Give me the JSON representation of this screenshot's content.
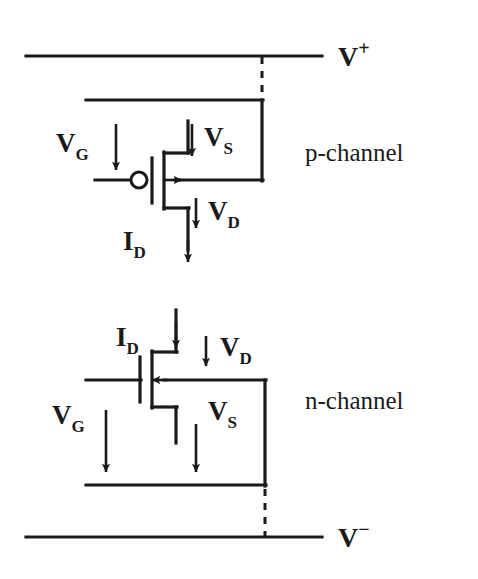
{
  "figure": {
    "background_color": "#ffffff",
    "ink_color": "#1a1a1a"
  },
  "rails": {
    "positive": {
      "label_base": "V",
      "label_sign": "+",
      "full_label": "V+",
      "name": "positive-supply-rail"
    },
    "negative": {
      "label_base": "V",
      "label_sign": "−",
      "full_label": "V−",
      "name": "negative-supply-rail"
    }
  },
  "sections": [
    {
      "id": "p-channel",
      "caption": "p-channel",
      "device": "p-channel MOSFET",
      "gate_bubble": true,
      "channel_arrow_direction": "right",
      "labels": [
        {
          "base": "V",
          "sub": "G",
          "full": "VG",
          "name": "gate-voltage-label",
          "arrow": "down",
          "arrow_side": "right"
        },
        {
          "base": "V",
          "sub": "S",
          "full": "VS",
          "name": "source-voltage-label",
          "arrow": "down",
          "arrow_side": "left"
        },
        {
          "base": "V",
          "sub": "D",
          "full": "VD",
          "name": "drain-voltage-label",
          "arrow": "down",
          "arrow_side": "left"
        },
        {
          "base": "I",
          "sub": "D",
          "full": "ID",
          "name": "drain-current-label",
          "arrow": "down",
          "arrow_side": "right"
        }
      ]
    },
    {
      "id": "n-channel",
      "caption": "n-channel",
      "device": "n-channel MOSFET",
      "gate_bubble": false,
      "channel_arrow_direction": "left",
      "labels": [
        {
          "base": "I",
          "sub": "D",
          "full": "ID",
          "name": "drain-current-label",
          "arrow": "down",
          "arrow_side": "right"
        },
        {
          "base": "V",
          "sub": "D",
          "full": "VD",
          "name": "drain-voltage-label",
          "arrow": "down",
          "arrow_side": "left"
        },
        {
          "base": "V",
          "sub": "G",
          "full": "VG",
          "name": "gate-voltage-label",
          "arrow": "down",
          "arrow_side": "right"
        },
        {
          "base": "V",
          "sub": "S",
          "full": "VS",
          "name": "source-voltage-label",
          "arrow": "down",
          "arrow_side": "left"
        }
      ]
    }
  ],
  "text": {
    "p_channel_caption": "p-channel",
    "n_channel_caption": "n-channel",
    "v_plus_base": "V",
    "v_plus_sign": "+",
    "v_minus_base": "V",
    "v_minus_sign": "−",
    "v_letter": "V",
    "i_letter": "I",
    "sub_g": "G",
    "sub_s": "S",
    "sub_d": "D"
  }
}
